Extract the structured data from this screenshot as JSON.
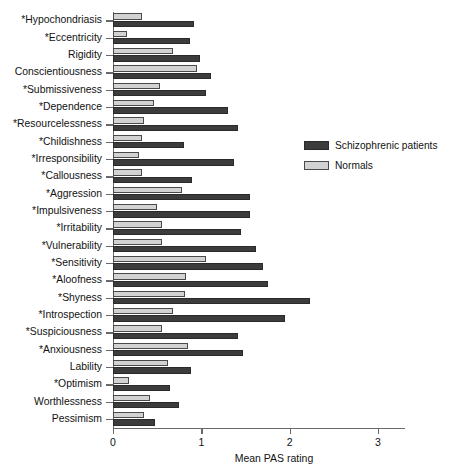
{
  "chart_data": {
    "type": "bar",
    "orientation": "horizontal",
    "title": "",
    "xlabel": "Mean PAS rating",
    "ylabel": "",
    "xlim": [
      0,
      3
    ],
    "xticks": [
      "0",
      "1",
      "2",
      "3"
    ],
    "grid": false,
    "legend_position": "right",
    "categories": [
      "*Hypochondriasis",
      "*Eccentricity",
      "Rigidity",
      "Conscientiousness",
      "*Submissiveness",
      "*Dependence",
      "*Resourcelessness",
      "*Childishness",
      "*Irresponsibility",
      "*Callousness",
      "*Aggression",
      "*Impulsiveness",
      "*Irritability",
      "*Vulnerability",
      "*Sensitivity",
      "*Aloofness",
      "*Shyness",
      "*Introspection",
      "*Suspiciousness",
      "*Anxiousness",
      "Lability",
      "*Optimism",
      "Worthlessness",
      "Pessimism"
    ],
    "series": [
      {
        "name": "Schizophrenic patients",
        "color": "#3c3c3c",
        "values": [
          0.92,
          0.87,
          0.98,
          1.11,
          1.05,
          1.3,
          1.42,
          0.8,
          1.37,
          0.9,
          1.55,
          1.55,
          1.45,
          1.62,
          1.7,
          1.75,
          2.23,
          1.95,
          1.42,
          1.47,
          0.88,
          0.65,
          0.75,
          0.48
        ]
      },
      {
        "name": "Normals",
        "color": "#d2d2d2",
        "values": [
          0.33,
          0.16,
          0.68,
          0.95,
          0.53,
          0.46,
          0.35,
          0.33,
          0.29,
          0.33,
          0.78,
          0.5,
          0.55,
          0.55,
          1.05,
          0.83,
          0.82,
          0.68,
          0.55,
          0.85,
          0.62,
          0.18,
          0.42,
          0.35
        ]
      }
    ],
    "annotations": {
      "asterisk_note": "*"
    }
  }
}
